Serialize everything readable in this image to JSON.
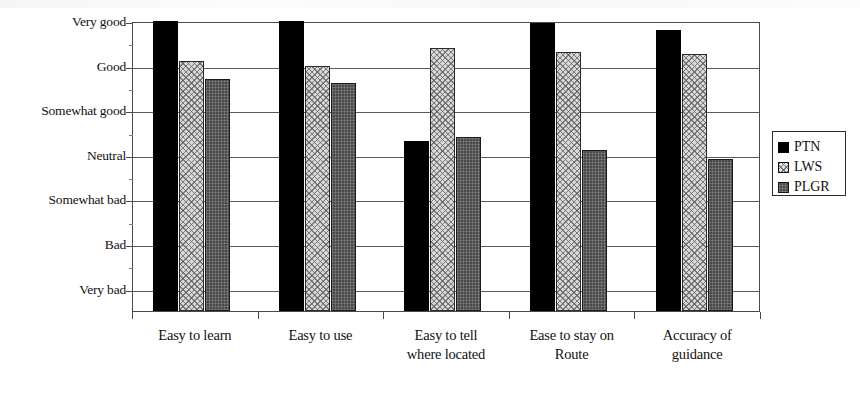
{
  "chart_data": {
    "type": "bar",
    "title": "",
    "xlabel": "",
    "ylabel": "",
    "grid": true,
    "legend_position": "right",
    "categories": [
      "Easy to learn",
      "Easy to use",
      "Easy to tell where located",
      "Ease to stay on Route",
      "Accuracy of guidance"
    ],
    "category_lines": [
      [
        "Easy to learn"
      ],
      [
        "Easy to use"
      ],
      [
        "Easy to tell",
        "where located"
      ],
      [
        "Ease to stay on",
        "Route"
      ],
      [
        "Accuracy of",
        "guidance"
      ]
    ],
    "ytick_labels": [
      "Very good",
      "Good",
      "Somewhat good",
      "Neutral",
      "Somewhat bad",
      "Bad",
      "Very bad"
    ],
    "ytick_values": [
      7,
      6,
      5,
      4,
      3,
      2,
      1
    ],
    "ylim": [
      0.5,
      7.0
    ],
    "series": [
      {
        "name": "PTN",
        "color": "#000000",
        "values": [
          7.0,
          7.0,
          4.3,
          6.95,
          6.8
        ]
      },
      {
        "name": "LWS",
        "color": "#d8d8d8",
        "values": [
          6.1,
          6.0,
          6.4,
          6.3,
          6.25
        ]
      },
      {
        "name": "PLGR",
        "color": "#4a4a4a",
        "values": [
          5.7,
          5.6,
          4.4,
          4.1,
          3.9
        ]
      }
    ]
  },
  "legend": {
    "items": [
      {
        "label": "PTN",
        "key": "ptn"
      },
      {
        "label": "LWS",
        "key": "lws"
      },
      {
        "label": "PLGR",
        "key": "plgr"
      }
    ]
  }
}
